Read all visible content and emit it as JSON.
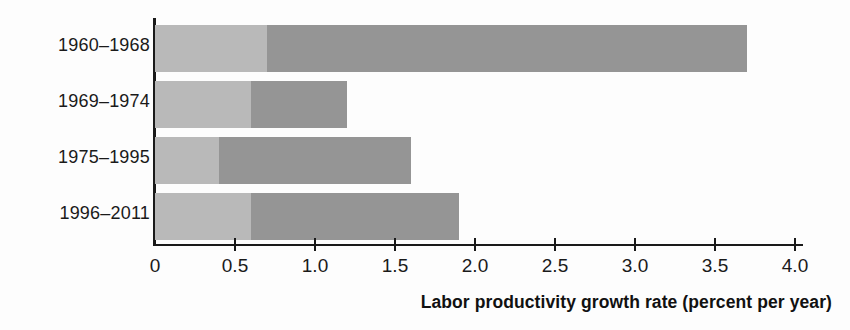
{
  "chart_data": {
    "type": "bar",
    "orientation": "horizontal",
    "stacked": true,
    "title": "",
    "xlabel": "Labor productivity growth rate (percent per year)",
    "ylabel": "",
    "categories": [
      "1960–1968",
      "1969–1974",
      "1975–1995",
      "1996–2011"
    ],
    "series": [
      {
        "name": "segment-light",
        "values": [
          0.7,
          0.6,
          0.4,
          0.6
        ]
      },
      {
        "name": "segment-dark",
        "values": [
          3.0,
          0.6,
          1.2,
          1.3
        ]
      }
    ],
    "totals": [
      3.7,
      1.2,
      1.6,
      1.9
    ],
    "xlim": [
      0,
      4.2
    ],
    "xticks": [
      0,
      0.5,
      1.0,
      1.5,
      2.0,
      2.5,
      3.0,
      3.5,
      4.0
    ],
    "xtick_labels": [
      "0",
      "0.5",
      "1.0",
      "1.5",
      "2.0",
      "2.5",
      "3.0",
      "3.5",
      "4.0"
    ],
    "grid": false,
    "legend": "none",
    "colors": {
      "segment_light": "#b9b9b9",
      "segment_dark": "#959595",
      "axis": "#1a1a1a",
      "background": "#fdfdfd",
      "text": "#1a1a1a"
    }
  }
}
